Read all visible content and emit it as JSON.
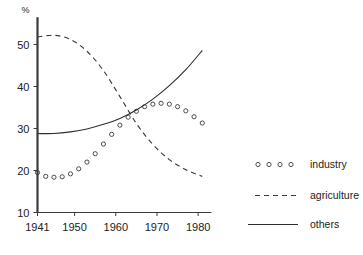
{
  "chart_data": {
    "type": "line",
    "title": "",
    "subtitle": "",
    "xlabel": "",
    "ylabel": "%",
    "unit_label": "%",
    "xlim": [
      1941,
      1982
    ],
    "ylim": [
      10,
      55
    ],
    "grid": false,
    "legend_position": "right",
    "x_ticks": [
      "1941",
      "1950",
      "1960",
      "1970",
      "1980"
    ],
    "x_tick_values": [
      1941,
      1950,
      1960,
      1970,
      1980
    ],
    "y_ticks": [
      "10",
      "20",
      "30",
      "40",
      "50"
    ],
    "y_tick_values": [
      10,
      20,
      30,
      40,
      50
    ],
    "series": [
      {
        "name": "industry",
        "style": "circles",
        "marker": "o",
        "color": "#3a3a3a",
        "x": [
          1941,
          1943,
          1945,
          1947,
          1949,
          1951,
          1953,
          1955,
          1957,
          1959,
          1961,
          1963,
          1965,
          1967,
          1969,
          1971,
          1973,
          1975,
          1977,
          1979,
          1981
        ],
        "values": [
          19.5,
          18.6,
          18.4,
          18.5,
          19.2,
          20.4,
          22.0,
          24.0,
          26.3,
          28.6,
          30.8,
          32.7,
          34.1,
          35.2,
          35.8,
          36.0,
          35.8,
          35.2,
          34.2,
          32.8,
          31.3
        ]
      },
      {
        "name": "agriculture",
        "style": "dashed",
        "color": "#3a3a3a",
        "x": [
          1941,
          1945,
          1949,
          1953,
          1957,
          1961,
          1965,
          1969,
          1973,
          1977,
          1981
        ],
        "values": [
          51.8,
          52.2,
          51.2,
          48.4,
          43.8,
          37.6,
          31.2,
          26.2,
          22.6,
          20.2,
          18.6
        ]
      },
      {
        "name": "others",
        "style": "solid",
        "color": "#2e2e2e",
        "x": [
          1941,
          1945,
          1949,
          1953,
          1957,
          1961,
          1965,
          1969,
          1973,
          1977,
          1981
        ],
        "values": [
          28.8,
          28.8,
          29.2,
          29.9,
          31.0,
          32.4,
          34.4,
          37.0,
          40.2,
          44.0,
          48.6
        ]
      }
    ]
  },
  "legend": {
    "entries": [
      {
        "label": "industry",
        "marker_name": "circle-marker-sample"
      },
      {
        "label": "agriculture",
        "marker_name": "dashed-line-sample"
      },
      {
        "label": "others",
        "marker_name": "solid-line-sample"
      }
    ]
  }
}
